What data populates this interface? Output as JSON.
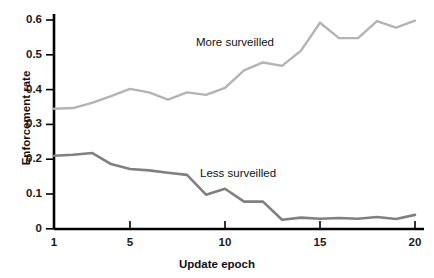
{
  "chart_data": {
    "type": "line",
    "title": "",
    "xlabel": "Update epoch",
    "ylabel": "Enforcement rate",
    "x": [
      1,
      2,
      3,
      4,
      5,
      6,
      7,
      8,
      9,
      10,
      11,
      12,
      13,
      14,
      15,
      16,
      17,
      18,
      19,
      20
    ],
    "xlim": [
      1,
      20
    ],
    "ylim": [
      0,
      0.63
    ],
    "xticks": [
      1,
      5,
      10,
      15,
      20
    ],
    "xtick_labels": [
      "1",
      "5",
      "10",
      "15",
      "20"
    ],
    "yticks": [
      0,
      0.1,
      0.2,
      0.3,
      0.4,
      0.5,
      0.6
    ],
    "ytick_labels": [
      "0",
      "0.1",
      "0.2",
      "0.3",
      "0.4",
      "0.5",
      "0.6"
    ],
    "grid": false,
    "legend": "inline-annotations",
    "series": [
      {
        "name": "More surveilled",
        "color": "#b3b3b3",
        "annotation": "More surveilled",
        "values": [
          0.345,
          0.347,
          0.362,
          0.381,
          0.402,
          0.392,
          0.371,
          0.392,
          0.385,
          0.405,
          0.455,
          0.478,
          0.468,
          0.512,
          0.592,
          0.548,
          0.548,
          0.597,
          0.578,
          0.598
        ]
      },
      {
        "name": "Less surveilled",
        "color": "#808080",
        "annotation": "Less surveilled",
        "values": [
          0.21,
          0.213,
          0.218,
          0.186,
          0.172,
          0.168,
          0.161,
          0.155,
          0.098,
          0.115,
          0.078,
          0.078,
          0.026,
          0.032,
          0.029,
          0.031,
          0.029,
          0.034,
          0.028,
          0.04
        ]
      }
    ]
  }
}
